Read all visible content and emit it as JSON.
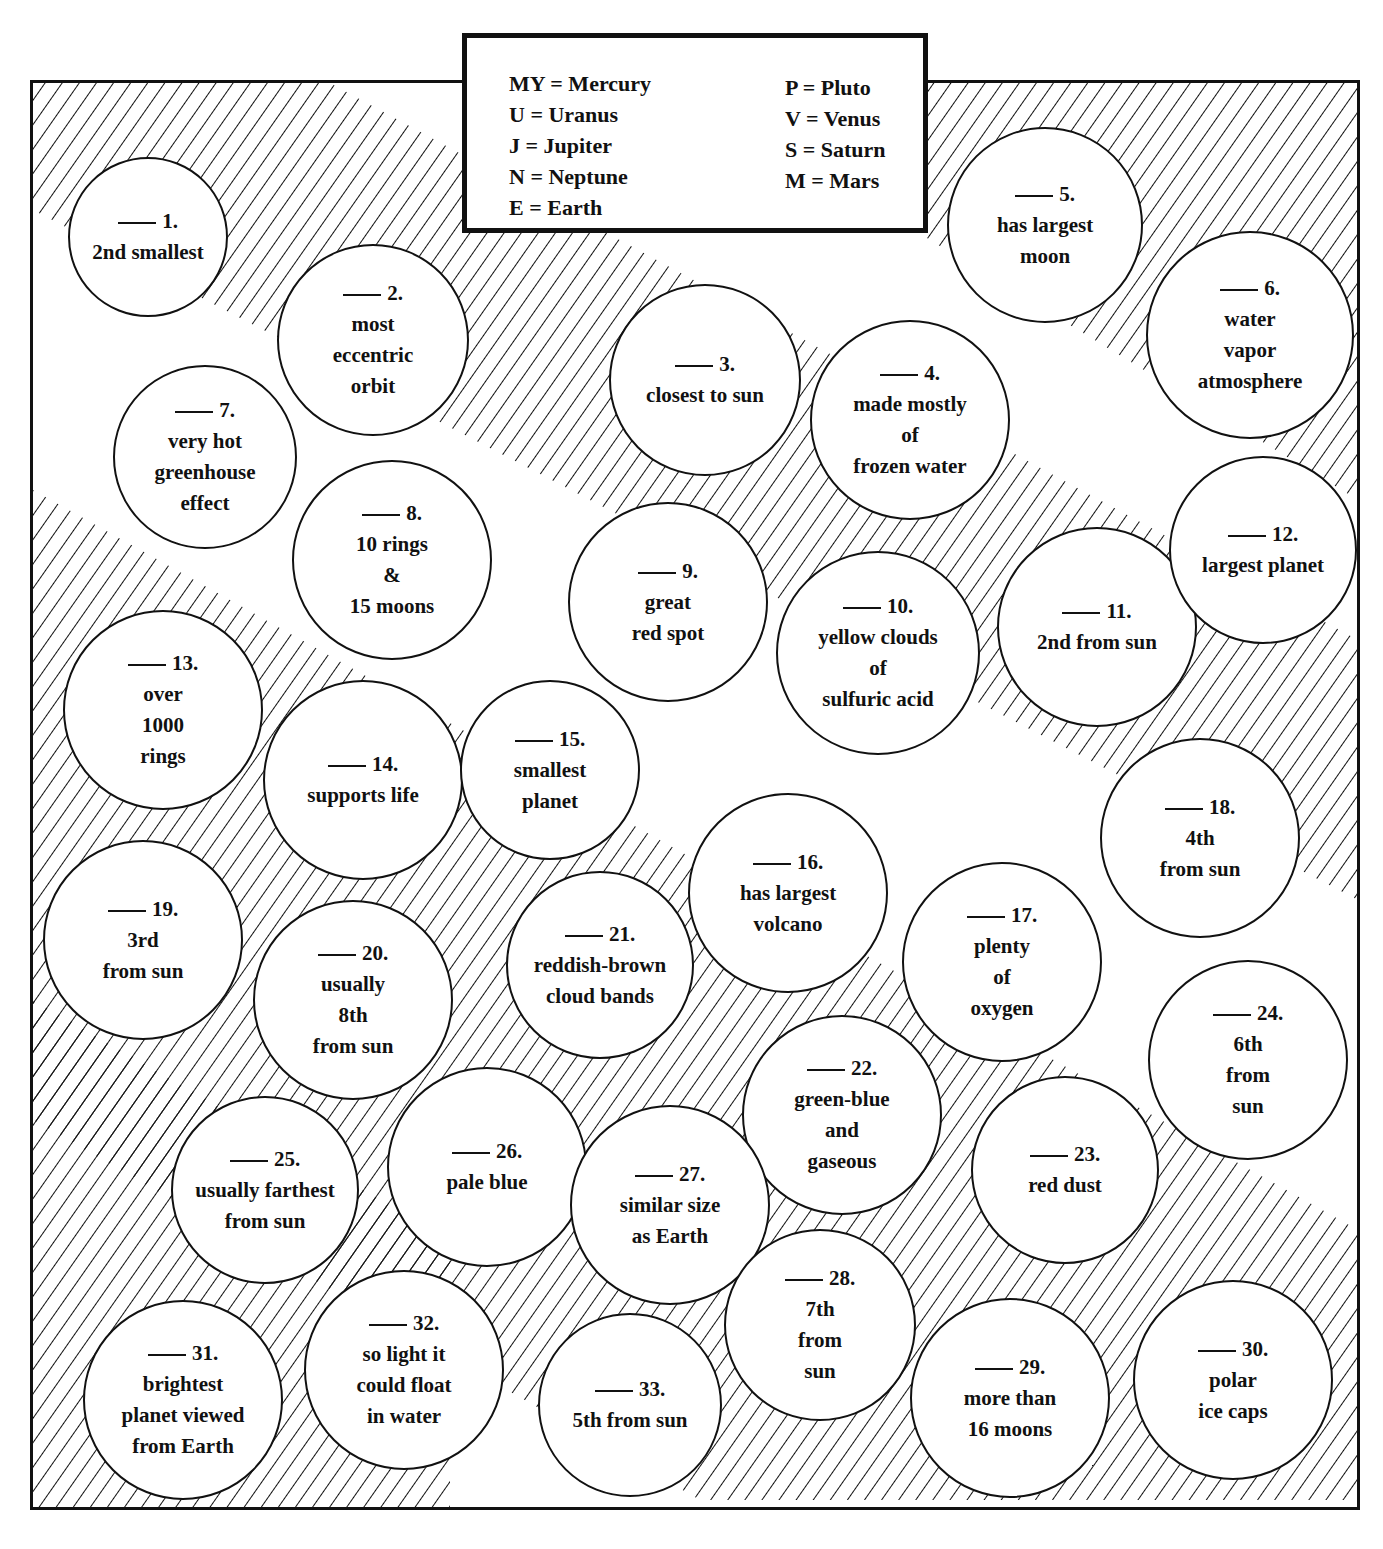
{
  "legend": {
    "left": [
      "MY = Mercury",
      "U = Uranus",
      "J = Jupiter",
      "N = Neptune",
      "E = Earth"
    ],
    "right": [
      "P = Pluto",
      "V = Venus",
      "S = Saturn",
      "M = Mars"
    ]
  },
  "items": [
    {
      "n": "1.",
      "lines": [
        "2nd smallest"
      ],
      "x": 148,
      "y": 237,
      "r": 80
    },
    {
      "n": "2.",
      "lines": [
        "most",
        "eccentric",
        "orbit"
      ],
      "x": 373,
      "y": 340,
      "r": 96
    },
    {
      "n": "3.",
      "lines": [
        "closest to sun"
      ],
      "x": 705,
      "y": 380,
      "r": 96
    },
    {
      "n": "4.",
      "lines": [
        "made mostly",
        "of",
        "frozen water"
      ],
      "x": 910,
      "y": 420,
      "r": 100
    },
    {
      "n": "5.",
      "lines": [
        "has largest",
        "moon"
      ],
      "x": 1045,
      "y": 225,
      "r": 98
    },
    {
      "n": "6.",
      "lines": [
        "water",
        "vapor",
        "atmosphere"
      ],
      "x": 1250,
      "y": 335,
      "r": 104
    },
    {
      "n": "7.",
      "lines": [
        "very hot",
        "greenhouse",
        "effect"
      ],
      "x": 205,
      "y": 457,
      "r": 92
    },
    {
      "n": "8.",
      "lines": [
        "10 rings",
        "&",
        "15 moons"
      ],
      "x": 392,
      "y": 560,
      "r": 100
    },
    {
      "n": "9.",
      "lines": [
        "great",
        "red spot"
      ],
      "x": 668,
      "y": 602,
      "r": 100
    },
    {
      "n": "10.",
      "lines": [
        "yellow clouds",
        "of",
        "sulfuric acid"
      ],
      "x": 878,
      "y": 653,
      "r": 102
    },
    {
      "n": "11.",
      "lines": [
        "2nd from sun"
      ],
      "x": 1097,
      "y": 627,
      "r": 100
    },
    {
      "n": "12.",
      "lines": [
        "largest planet"
      ],
      "x": 1263,
      "y": 550,
      "r": 94
    },
    {
      "n": "13.",
      "lines": [
        "over",
        "1000",
        "rings"
      ],
      "x": 163,
      "y": 710,
      "r": 100
    },
    {
      "n": "14.",
      "lines": [
        "supports life"
      ],
      "x": 363,
      "y": 780,
      "r": 100
    },
    {
      "n": "15.",
      "lines": [
        "smallest",
        "planet"
      ],
      "x": 550,
      "y": 770,
      "r": 90
    },
    {
      "n": "16.",
      "lines": [
        "has largest",
        "volcano"
      ],
      "x": 788,
      "y": 893,
      "r": 100
    },
    {
      "n": "17.",
      "lines": [
        "plenty",
        "of",
        "oxygen"
      ],
      "x": 1002,
      "y": 962,
      "r": 100
    },
    {
      "n": "18.",
      "lines": [
        "4th",
        "from sun"
      ],
      "x": 1200,
      "y": 838,
      "r": 100
    },
    {
      "n": "19.",
      "lines": [
        "3rd",
        "from sun"
      ],
      "x": 143,
      "y": 940,
      "r": 100
    },
    {
      "n": "20.",
      "lines": [
        "usually",
        "8th",
        "from sun"
      ],
      "x": 353,
      "y": 1000,
      "r": 100
    },
    {
      "n": "21.",
      "lines": [
        "reddish-brown",
        "cloud bands"
      ],
      "x": 600,
      "y": 965,
      "r": 94
    },
    {
      "n": "22.",
      "lines": [
        "green-blue",
        "and",
        "gaseous"
      ],
      "x": 842,
      "y": 1115,
      "r": 100
    },
    {
      "n": "23.",
      "lines": [
        "red dust"
      ],
      "x": 1065,
      "y": 1170,
      "r": 94
    },
    {
      "n": "24.",
      "lines": [
        "6th",
        "from",
        "sun"
      ],
      "x": 1248,
      "y": 1060,
      "r": 100
    },
    {
      "n": "25.",
      "lines": [
        "usually farthest",
        "from sun"
      ],
      "x": 265,
      "y": 1190,
      "r": 94
    },
    {
      "n": "26.",
      "lines": [
        "pale blue"
      ],
      "x": 487,
      "y": 1167,
      "r": 100
    },
    {
      "n": "27.",
      "lines": [
        "similar size",
        "as Earth"
      ],
      "x": 670,
      "y": 1205,
      "r": 100
    },
    {
      "n": "28.",
      "lines": [
        "7th",
        "from",
        "sun"
      ],
      "x": 820,
      "y": 1325,
      "r": 96
    },
    {
      "n": "29.",
      "lines": [
        "more than",
        "16 moons"
      ],
      "x": 1010,
      "y": 1398,
      "r": 100
    },
    {
      "n": "30.",
      "lines": [
        "polar",
        "ice caps"
      ],
      "x": 1233,
      "y": 1380,
      "r": 100
    },
    {
      "n": "31.",
      "lines": [
        "brightest",
        "planet viewed",
        "from Earth"
      ],
      "x": 183,
      "y": 1400,
      "r": 100
    },
    {
      "n": "32.",
      "lines": [
        "so light it",
        "could float",
        "in water"
      ],
      "x": 404,
      "y": 1370,
      "r": 100
    },
    {
      "n": "33.",
      "lines": [
        "5th from sun"
      ],
      "x": 630,
      "y": 1405,
      "r": 92
    }
  ],
  "colors": {
    "ink": "#111111",
    "paper": "#ffffff"
  }
}
